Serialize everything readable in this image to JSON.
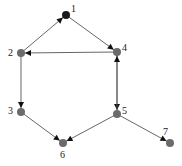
{
  "diagram": {
    "type": "directed-graph",
    "colors": {
      "node_default": "#6b6b6b",
      "node_highlight": "#1a1a1a",
      "edge": "#555555",
      "arrow": "#111111",
      "label": "#222222"
    },
    "nodes": [
      {
        "id": "1",
        "label": "1",
        "x": 66,
        "y": 15,
        "highlight": true,
        "lx": 71,
        "ly": 12
      },
      {
        "id": "2",
        "label": "2",
        "x": 21,
        "y": 53,
        "highlight": false,
        "lx": 8,
        "ly": 56
      },
      {
        "id": "3",
        "label": "3",
        "x": 21,
        "y": 112,
        "highlight": false,
        "lx": 8,
        "ly": 114
      },
      {
        "id": "4",
        "label": "4",
        "x": 117,
        "y": 52,
        "highlight": false,
        "lx": 122,
        "ly": 51
      },
      {
        "id": "5",
        "label": "5",
        "x": 117,
        "y": 114,
        "highlight": false,
        "lx": 122,
        "ly": 114
      },
      {
        "id": "6",
        "label": "6",
        "x": 63,
        "y": 143,
        "highlight": false,
        "lx": 60,
        "ly": 158
      },
      {
        "id": "7",
        "label": "7",
        "x": 170,
        "y": 143,
        "highlight": false,
        "lx": 163,
        "ly": 135
      }
    ],
    "edges": [
      {
        "from": "2",
        "to": "1"
      },
      {
        "from": "1",
        "to": "4"
      },
      {
        "from": "4",
        "to": "2"
      },
      {
        "from": "4",
        "to": "5"
      },
      {
        "from": "5",
        "to": "4"
      },
      {
        "from": "2",
        "to": "3"
      },
      {
        "from": "3",
        "to": "6"
      },
      {
        "from": "5",
        "to": "6"
      },
      {
        "from": "5",
        "to": "7"
      }
    ]
  }
}
